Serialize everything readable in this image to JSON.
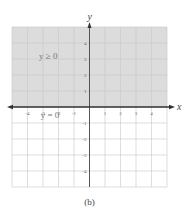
{
  "chart_data": {
    "type": "region",
    "title": "",
    "caption": "(b)",
    "xlabel": "x",
    "ylabel": "y",
    "xlim": [
      -5,
      5
    ],
    "ylim": [
      -5,
      5
    ],
    "grid": true,
    "x_ticks": [
      -4,
      -3,
      -2,
      -1,
      1,
      2,
      3,
      4
    ],
    "y_ticks": [
      -4,
      -3,
      -2,
      -1,
      1,
      2,
      3,
      4
    ],
    "x_tick_labels": [
      "-4",
      "-3",
      "-2",
      "-1",
      "1",
      "2",
      "3",
      "4"
    ],
    "y_tick_labels": [
      "-4",
      "-3",
      "-2",
      "-1",
      "1",
      "2",
      "3",
      "4"
    ],
    "shaded_region": {
      "inequality": "y ≥ 0",
      "y_from": 0,
      "y_to": 5,
      "color": "#dcdcdc"
    },
    "boundary_line": {
      "equation": "y = 0",
      "style": "solid"
    },
    "annotations": [
      {
        "text": "y ≥ 0",
        "x": -3,
        "y": 3.2
      },
      {
        "text": "y = 0",
        "x": -2.5,
        "y": -0.5
      }
    ]
  }
}
